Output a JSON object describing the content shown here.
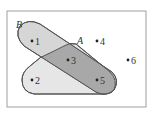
{
  "diagram": {
    "type": "venn",
    "sets": [
      {
        "name": "A",
        "elements": [
          "2",
          "3",
          "5"
        ]
      },
      {
        "name": "B",
        "elements": [
          "1",
          "3",
          "5"
        ]
      }
    ],
    "intersection": [
      "3",
      "5"
    ],
    "universe_only": [
      "4",
      "6"
    ],
    "points": [
      {
        "label": "1",
        "x": 32,
        "y": 41
      },
      {
        "label": "2",
        "x": 32,
        "y": 80
      },
      {
        "label": "3",
        "x": 68,
        "y": 60
      },
      {
        "label": "4",
        "x": 97,
        "y": 41
      },
      {
        "label": "5",
        "x": 97,
        "y": 80
      },
      {
        "label": "6",
        "x": 128,
        "y": 60
      }
    ],
    "set_labels": {
      "A": "A",
      "B": "B"
    },
    "colors": {
      "a_only": "#e6e6e6",
      "b_only": "#d6d6d6",
      "a_and_b": "#a8a8a8",
      "outline": "#555555",
      "frame": "#888888"
    }
  }
}
